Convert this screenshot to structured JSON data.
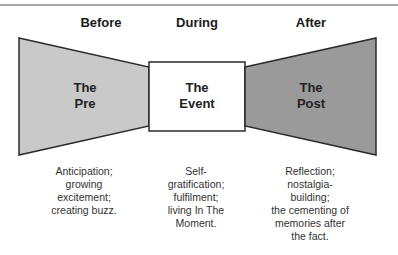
{
  "phases": [
    {
      "heading": "Before",
      "label_line1": "The",
      "label_line2": "Pre",
      "description": [
        "Anticipation;",
        "growing",
        "excitement;",
        "creating buzz."
      ]
    },
    {
      "heading": "During",
      "label_line1": "The",
      "label_line2": "Event",
      "description": [
        "Self-",
        "gratification;",
        "fulfilment;",
        "living In The",
        "Moment."
      ]
    },
    {
      "heading": "After",
      "label_line1": "The",
      "label_line2": "Post",
      "description": [
        "Reflection;",
        "nostalgia-",
        "building;",
        "the cementing of",
        "memories after",
        "the fact."
      ]
    }
  ],
  "colors": {
    "pre_fill": "#c9c9c9",
    "event_fill": "#ffffff",
    "post_fill": "#9a9a9a",
    "stroke": "#2a2a2a"
  }
}
